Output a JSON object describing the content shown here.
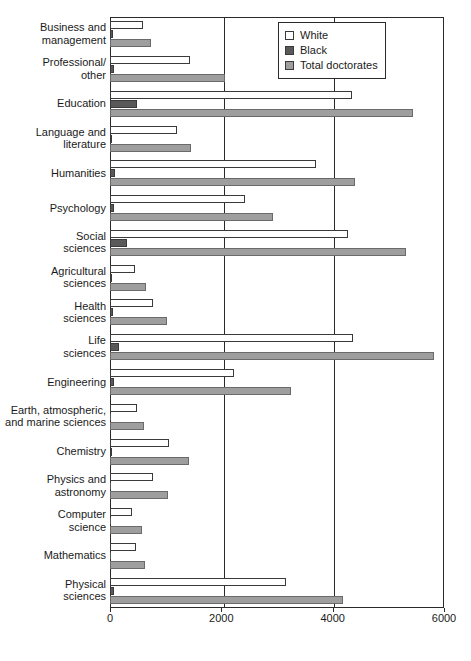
{
  "chart_data": {
    "type": "bar",
    "orientation": "horizontal",
    "title": "",
    "subtitle": "",
    "xlabel": "",
    "ylabel": "",
    "xlim": [
      0,
      6000
    ],
    "xticks": [
      0,
      2000,
      4000,
      6000
    ],
    "xtick_labels": [
      "0",
      "2000",
      "4000",
      "6000"
    ],
    "grid": "vertical-at-xticks",
    "legend_position": "top-right-inside",
    "categories": [
      "Business and\nmanagement",
      "Professional/\nother",
      "Education",
      "Language and\nliterature",
      "Humanities",
      "Psychology",
      "Social\nsciences",
      "Agricultural\nsciences",
      "Health\nsciences",
      "Life\nsciences",
      "Engineering",
      "Earth, atmospheric,\nand marine sciences",
      "Chemistry",
      "Physics and\nastronomy",
      "Computer\nscience",
      "Mathematics",
      "Physical\nsciences"
    ],
    "series": [
      {
        "name": "White",
        "color": "#ffffff",
        "values": [
          600,
          1440,
          4350,
          1200,
          3700,
          2430,
          4270,
          450,
          770,
          4370,
          2230,
          490,
          1060,
          770,
          400,
          470,
          3160
        ]
      },
      {
        "name": "Black",
        "color": "#595959",
        "values": [
          60,
          70,
          490,
          40,
          85,
          70,
          310,
          35,
          55,
          160,
          70,
          0,
          40,
          10,
          0,
          0,
          70
        ]
      },
      {
        "name": "Total doctorates",
        "color": "#9e9e9e",
        "values": [
          730,
          2060,
          5450,
          1450,
          4400,
          2930,
          5310,
          640,
          1020,
          5820,
          3260,
          610,
          1420,
          1040,
          580,
          630,
          4180
        ]
      }
    ]
  },
  "legend": {
    "items": [
      {
        "label": "White",
        "key": "white"
      },
      {
        "label": "Black",
        "key": "black"
      },
      {
        "label": "Total doctorates",
        "key": "total"
      }
    ]
  }
}
